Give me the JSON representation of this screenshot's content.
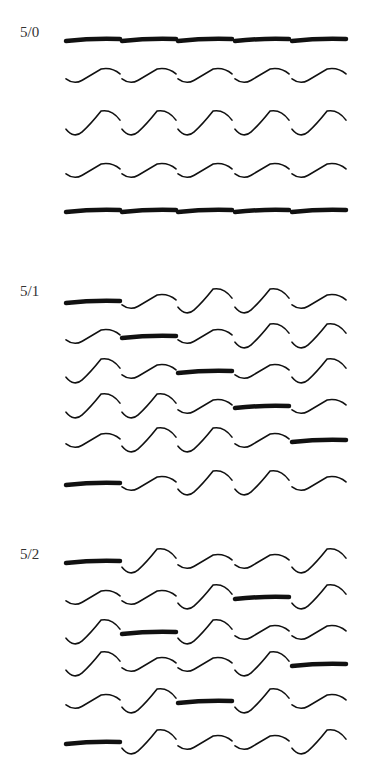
{
  "diagram": {
    "legend": {
      "T": "thick float (bar)",
      "S": "small wave",
      "L": "large wave"
    },
    "colors": {
      "ink": "#111111",
      "label": "#333333",
      "background": "#ffffff"
    },
    "columns_x": [
      66,
      122,
      178,
      235,
      292
    ],
    "cell_width": 54,
    "panels": [
      {
        "label": "5/0",
        "label_y": 34,
        "rows_y": [
          40,
          76,
          124,
          171,
          211
        ],
        "rows": [
          [
            "T",
            "T",
            "T",
            "T",
            "T"
          ],
          [
            "S",
            "S",
            "S",
            "S",
            "S"
          ],
          [
            "L",
            "L",
            "L",
            "L",
            "L"
          ],
          [
            "S",
            "S",
            "S",
            "S",
            "S"
          ],
          [
            "T",
            "T",
            "T",
            "T",
            "T"
          ]
        ]
      },
      {
        "label": "5/1",
        "label_y": 293,
        "rows_y": [
          302,
          337,
          372,
          407,
          441,
          484
        ],
        "rows": [
          [
            "T",
            "S",
            "L",
            "L",
            "S"
          ],
          [
            "S",
            "T",
            "S",
            "L",
            "L"
          ],
          [
            "L",
            "S",
            "T",
            "S",
            "L"
          ],
          [
            "L",
            "L",
            "S",
            "T",
            "S"
          ],
          [
            "S",
            "L",
            "L",
            "S",
            "T"
          ],
          [
            "T",
            "S",
            "L",
            "L",
            "S"
          ]
        ]
      },
      {
        "label": "5/2",
        "label_y": 556,
        "rows_y": [
          562,
          598,
          633,
          665,
          702,
          743
        ],
        "rows": [
          [
            "T",
            "L",
            "S",
            "S",
            "L"
          ],
          [
            "S",
            "S",
            "L",
            "T",
            "L"
          ],
          [
            "L",
            "T",
            "L",
            "S",
            "S"
          ],
          [
            "L",
            "S",
            "S",
            "L",
            "T"
          ],
          [
            "S",
            "L",
            "T",
            "L",
            "S"
          ],
          [
            "T",
            "L",
            "S",
            "S",
            "L"
          ]
        ]
      }
    ]
  }
}
